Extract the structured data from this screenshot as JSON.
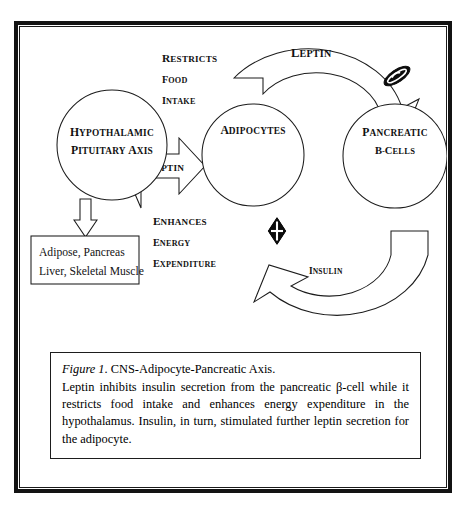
{
  "figure": {
    "nodes": {
      "hypothalamic": {
        "line1": "Hypothalamic",
        "line2": "Pituitary Axis"
      },
      "adipocytes": {
        "label": "Adipocytes"
      },
      "pancreatic": {
        "line1": "Pancreatic",
        "line2": "B-cells"
      },
      "tissue_box": {
        "line1": "Adipose, Pancreas",
        "line2": "Liver, Skeletal Muscle"
      }
    },
    "arrows": {
      "leptin_to_hypothalamus": "Leptin",
      "leptin_to_pancreas": "Leptin",
      "insulin_to_adipocyte": "Insulin"
    },
    "annotations": {
      "restricts_food_intake": {
        "line1": "Restricts",
        "line2": "food",
        "line3": "intake"
      },
      "enhances_energy_expenditure": {
        "line1": "Enhances",
        "line2": "energy",
        "line3": "expenditure"
      }
    },
    "markers": {
      "inhibition_marker": "filled-ellipse-inhibition-symbol",
      "stimulation_marker": "diamond-cross-symbol"
    },
    "caption": {
      "figure_label": "Figure 1",
      "title": ". CNS-Adipocyte-Pancreatic Axis.",
      "body": "Leptin inhibits insulin secretion from the pancreatic β-cell while it restricts food intake and enhances energy expenditure in the hypothalamus. Insulin, in turn, stimulated further leptin secretion for the adipocyte."
    }
  },
  "colors": {
    "ink": "#131313",
    "line": "#1c1c1c",
    "paper": "#ffffff"
  }
}
